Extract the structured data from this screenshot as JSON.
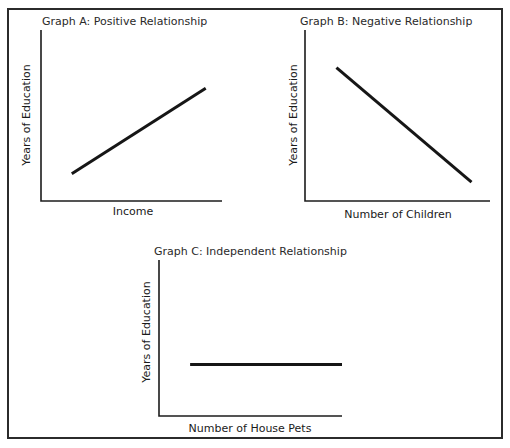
{
  "chart_data": [
    {
      "type": "line",
      "id": "graph-a",
      "title": "Graph A: Positive Relationship",
      "xlabel": "Income",
      "ylabel": "Years of Education",
      "xlim": [
        0,
        100
      ],
      "ylim": [
        0,
        100
      ],
      "grid": false,
      "series": [
        {
          "name": "relationship",
          "x": [
            17,
            91
          ],
          "y": [
            16,
            66
          ]
        }
      ]
    },
    {
      "type": "line",
      "id": "graph-b",
      "title": "Graph B: Negative Relationship",
      "xlabel": "Number of Children",
      "ylabel": "Years of Education",
      "xlim": [
        0,
        100
      ],
      "ylim": [
        0,
        100
      ],
      "grid": false,
      "series": [
        {
          "name": "relationship",
          "x": [
            17,
            90
          ],
          "y": [
            78,
            11
          ]
        }
      ]
    },
    {
      "type": "line",
      "id": "graph-c",
      "title": "Graph C: Independent Relationship",
      "xlabel": "Number of House Pets",
      "ylabel": "Years of Education",
      "xlim": [
        0,
        100
      ],
      "ylim": [
        0,
        100
      ],
      "grid": false,
      "series": [
        {
          "name": "relationship",
          "x": [
            17,
            100
          ],
          "y": [
            33,
            33
          ]
        }
      ]
    }
  ]
}
